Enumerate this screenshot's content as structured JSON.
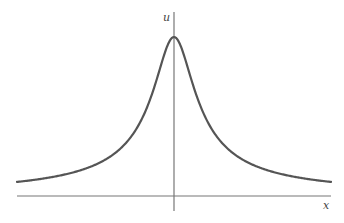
{
  "figure": {
    "type": "function-sketch",
    "axes": {
      "x_label": "x",
      "y_label": "u"
    },
    "colors": {
      "curve": "#555555",
      "axis": "#777777",
      "background": "#ffffff"
    }
  },
  "chart_data": {
    "type": "line",
    "title": "",
    "xlabel": "x",
    "ylabel": "u",
    "grid": false,
    "legend": null,
    "series": [
      {
        "name": "u(x)",
        "shape": "symmetric peak centered at x=0, rounded top, slowly decaying tails",
        "x": [
          -1.0,
          -0.67,
          -0.29,
          -0.11,
          0,
          0.11,
          0.29,
          0.67,
          1.0
        ],
        "values": [
          0.09,
          0.16,
          0.33,
          0.73,
          1.0,
          0.73,
          0.33,
          0.16,
          0.1
        ]
      }
    ]
  }
}
